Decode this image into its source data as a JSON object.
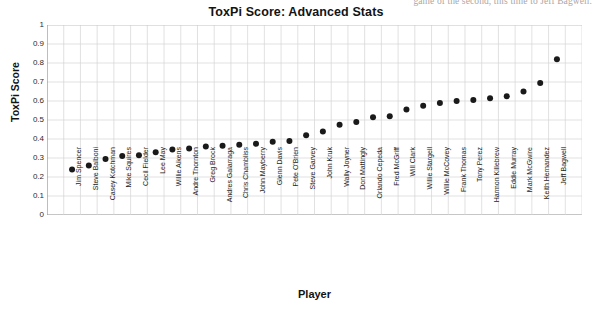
{
  "page": {
    "clipped_top_text": "game of the second, this time to Jeff Bagwell."
  },
  "chart_data": {
    "type": "scatter",
    "title": "ToxPi Score: Advanced Stats",
    "xlabel": "Player",
    "ylabel": "ToxPi Score",
    "ylim": [
      0,
      1
    ],
    "ytick_labels": [
      "1",
      "0.9",
      "0.8",
      "0.7",
      "0.6",
      "0.5",
      "0.4",
      "0.3",
      "0.2",
      "0.1",
      "0"
    ],
    "ytick_values": [
      1,
      0.9,
      0.8,
      0.7,
      0.6,
      0.5,
      0.4,
      0.3,
      0.2,
      0.1,
      0
    ],
    "grid": true,
    "legend": false,
    "marker": "filled-circle",
    "marker_color": "#1a1a1a",
    "categories": [
      "Jim Spencer",
      "Steve Balboni",
      "Casey Kotchman",
      "Mike Squires",
      "Cecil Fielder",
      "Lee May",
      "Willie Aikens",
      "Andre Thornton",
      "Greg Brock",
      "Andres Galarraga",
      "Chris Chambliss",
      "John Mayberry",
      "Glenn Davis",
      "Pete O'Brien",
      "Steve Garvey",
      "John Kruk",
      "Wally Joyner",
      "Don Mattingly",
      "Orlando Cepeda",
      "Fred McGriff",
      "Will Clark",
      "Willie Stargell",
      "Willie McCovey",
      "Frank Thomas",
      "Tony Perez",
      "Harmon Killebrew",
      "Eddie Murray",
      "Mark McGwire",
      "Keith Hernandez",
      "Jeff Bagwell"
    ],
    "values": [
      0.24,
      0.26,
      0.295,
      0.31,
      0.315,
      0.33,
      0.345,
      0.35,
      0.36,
      0.365,
      0.37,
      0.375,
      0.385,
      0.39,
      0.42,
      0.44,
      0.475,
      0.49,
      0.515,
      0.52,
      0.555,
      0.575,
      0.59,
      0.6,
      0.605,
      0.615,
      0.625,
      0.65,
      0.695,
      0.82
    ]
  }
}
